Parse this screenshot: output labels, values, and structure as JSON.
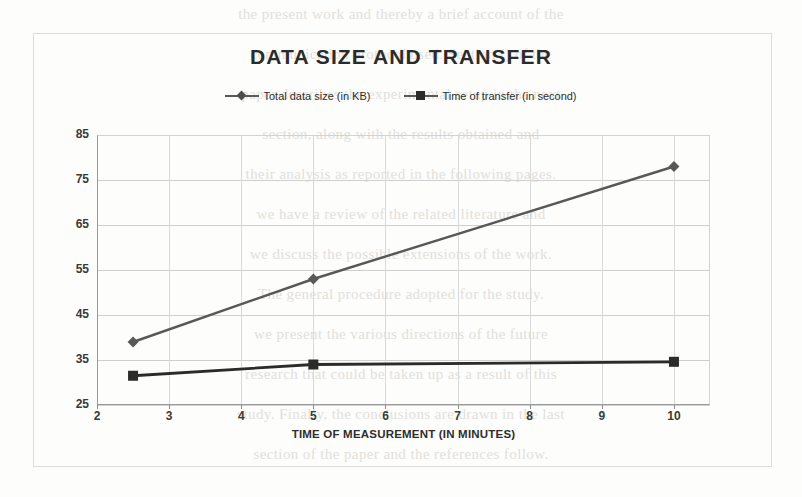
{
  "chart_data": {
    "type": "line",
    "title": "DATA SIZE AND TRANSFER",
    "xlabel": "TIME OF MEASUREMENT (IN MINUTES)",
    "ylabel": "",
    "x": [
      2.5,
      5,
      10
    ],
    "xlim": [
      2,
      10.5
    ],
    "ylim": [
      25,
      85
    ],
    "xticks": [
      2,
      3,
      4,
      5,
      6,
      7,
      8,
      9,
      10
    ],
    "yticks": [
      25,
      35,
      45,
      55,
      65,
      75,
      85
    ],
    "grid": "horizontal-and-vertical",
    "legend_position": "top-center",
    "series": [
      {
        "name": "Total data size (in KB)",
        "marker": "diamond",
        "color": "#585858",
        "values": [
          39,
          53,
          78
        ]
      },
      {
        "name": "Time of transfer (in second)",
        "marker": "square",
        "color": "#2b2b2b",
        "values": [
          31.5,
          34,
          34.6
        ]
      }
    ]
  },
  "chart": {
    "title": "DATA SIZE AND TRANSFER",
    "xaxis_title": "TIME OF MEASUREMENT (IN MINUTES)"
  },
  "legend": {
    "items": [
      {
        "label": "Total data size (in KB)"
      },
      {
        "label": "Time of transfer (in second)"
      }
    ]
  },
  "background_text": {
    "lines": [
      "the present work and thereby a brief account of the",
      "communication protocol used. Section () of the",
      "paper describes the experimental setup in the next",
      "section, along with the results obtained and",
      "their analysis as reported in the following pages.",
      "we have a review of the related literature and",
      "we discuss the possible extensions of the work.",
      "The general procedure adopted for the study.",
      "we present the various directions of the future",
      "research that could be taken up as a result of this",
      "study. Finally, the conclusions are drawn in the last",
      "section of the paper and the references follow."
    ]
  }
}
